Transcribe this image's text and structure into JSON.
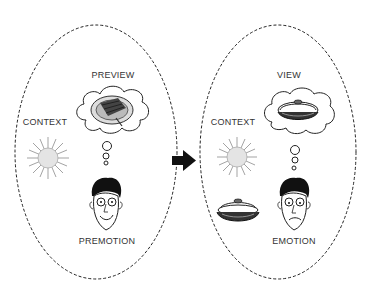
{
  "diagram": {
    "left_panel": {
      "title": "PREVIEW",
      "context_label": "CONTEXT",
      "person_label": "PREMOTION",
      "thought_content": "food-plate-icon"
    },
    "right_panel": {
      "title": "VIEW",
      "context_label": "CONTEXT",
      "person_label": "EMOTION",
      "thought_content": "covered-dish-icon",
      "real_object": "covered-dish-icon"
    },
    "transition": "arrow-right-icon"
  },
  "colors": {
    "line": "#222222",
    "sun": "#999999",
    "text": "#333333",
    "background": "#ffffff"
  }
}
